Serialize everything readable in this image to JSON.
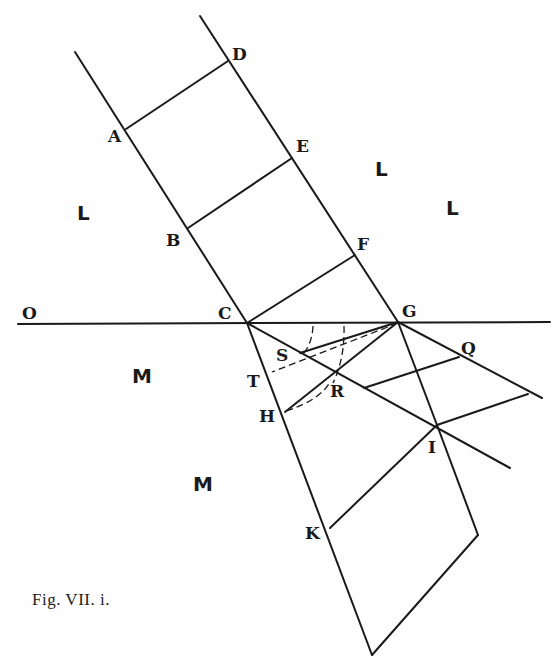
{
  "figure": {
    "caption": "Fig. VII. i.",
    "stroke_color": "#1a1a1a",
    "background": "#fefefe"
  },
  "points": {
    "A": "A",
    "B": "B",
    "C": "C",
    "D": "D",
    "E": "E",
    "F": "F",
    "G": "G",
    "H": "H",
    "I": "I",
    "K": "K",
    "O": "O",
    "Q": "Q",
    "R": "R",
    "S": "S",
    "T": "T"
  },
  "regions": {
    "upper_left": "L",
    "upper_mid": "L",
    "upper_right": "L",
    "lower_left": "M",
    "lower_mid": "M"
  }
}
